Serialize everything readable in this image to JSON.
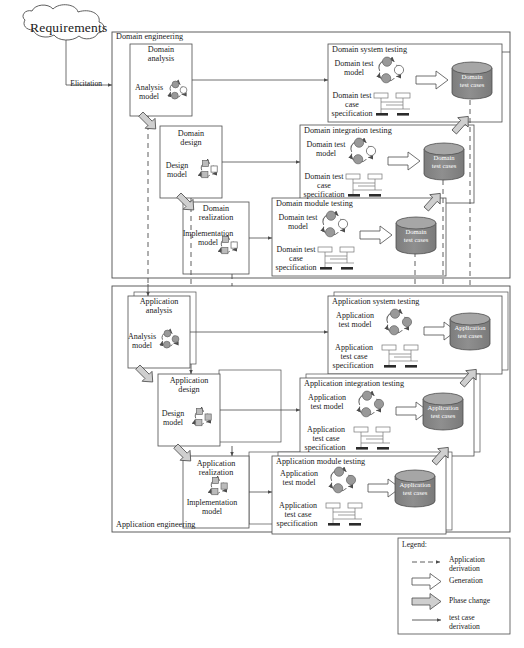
{
  "figure": {
    "requirements_cloud": "Requirements",
    "elicitation_label": "Elicitation"
  },
  "domain_engineering": {
    "frame_label": "Domain engineering",
    "phases": [
      {
        "title_line1": "Domain",
        "title_line2": "analysis",
        "artifact_line1": "Analysis",
        "artifact_line2": "model",
        "artifact_icon": "state-machine-circles-icon"
      },
      {
        "title_line1": "Domain",
        "title_line2": "design",
        "artifact_line1": "Design",
        "artifact_line2": "model",
        "artifact_icon": "state-machine-squares-icon"
      },
      {
        "title_line1": "Domain",
        "title_line2": "realization",
        "artifact_line1": "Implementation",
        "artifact_line2": "model",
        "artifact_icon": "state-machine-squares-icon"
      }
    ],
    "testing": [
      {
        "title": "Domain system testing",
        "model_line1": "Domain test",
        "model_line2": "model",
        "spec_line1": "Domain test",
        "spec_line2": "case",
        "spec_line3": "specification",
        "output_line1": "Domain",
        "output_line2": "test cases"
      },
      {
        "title": "Domain integration testing",
        "model_line1": "Domain test",
        "model_line2": "model",
        "spec_line1": "Domain test",
        "spec_line2": "case",
        "spec_line3": "specification",
        "output_line1": "Domain",
        "output_line2": "test cases"
      },
      {
        "title": "Domain module testing",
        "model_line1": "Domain test",
        "model_line2": "model",
        "spec_line1": "Domain test",
        "spec_line2": "case",
        "spec_line3": "specification",
        "output_line1": "Domain",
        "output_line2": "test cases"
      }
    ]
  },
  "application_engineering": {
    "frame_label": "Application engineering",
    "phases": [
      {
        "title_line1": "Application",
        "title_line2": "analysis",
        "artifact_line1": "Analysis",
        "artifact_line2": "model",
        "artifact_icon": "state-machine-circles-icon"
      },
      {
        "title_line1": "Application",
        "title_line2": "design",
        "artifact_line1": "Design",
        "artifact_line2": "model",
        "artifact_icon": "state-machine-squares-icon"
      },
      {
        "title_line1": "Application",
        "title_line2": "realization",
        "artifact_line1": "Implementation",
        "artifact_line2": "model",
        "artifact_icon": "state-machine-squares-icon"
      }
    ],
    "testing": [
      {
        "title": "Application system testing",
        "model_line1": "Application",
        "model_line2": "test model",
        "spec_line1": "Application",
        "spec_line2": "test case",
        "spec_line3": "specification",
        "output_line1": "Application",
        "output_line2": "test cases"
      },
      {
        "title": "Application integration testing",
        "model_line1": "Application",
        "model_line2": "test model",
        "spec_line1": "Application",
        "spec_line2": "test case",
        "spec_line3": "specification",
        "output_line1": "Application",
        "output_line2": "test cases"
      },
      {
        "title": "Application module testing",
        "model_line1": "Application",
        "model_line2": "test model",
        "spec_line1": "Application",
        "spec_line2": "test case",
        "spec_line3": "specification",
        "output_line1": "Application",
        "output_line2": "test cases"
      }
    ]
  },
  "legend": {
    "title": "Legend:",
    "items": [
      {
        "icon": "dashed-arrow-icon",
        "line1": "Application",
        "line2": "derivation"
      },
      {
        "icon": "hollow-block-arrow-icon",
        "line1": "Generation",
        "line2": ""
      },
      {
        "icon": "gray-block-arrow-icon",
        "line1": "Phase change",
        "line2": ""
      },
      {
        "icon": "solid-arrow-icon",
        "line1": "test case",
        "line2": "derivation"
      }
    ]
  },
  "colors": {
    "stroke": "#4d4d4d",
    "cylinder_fill": "#8c8c8c",
    "cylinder_top": "#a6a6a6",
    "node_fill": "#999999",
    "arrow_gray": "#b3b3b3",
    "background": "#ffffff"
  }
}
